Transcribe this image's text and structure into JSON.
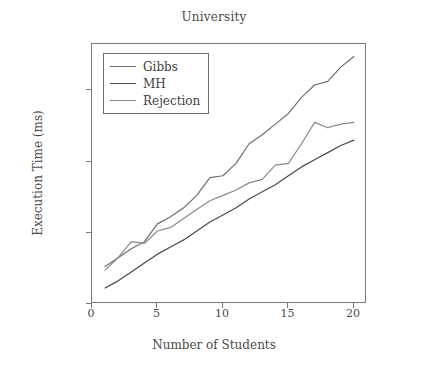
{
  "chart_data": {
    "type": "line",
    "title": "University",
    "xlabel": "Number of Students",
    "ylabel": "Execution Time (ms)",
    "xlim": [
      0,
      21
    ],
    "ylim": [
      0,
      7300
    ],
    "grid": false,
    "legend_position": "top-left",
    "xticks": [
      0,
      5,
      10,
      15,
      20
    ],
    "xtick_labels": [
      "0",
      "5",
      "10",
      "15",
      "20"
    ],
    "yticks": [
      0,
      2000,
      4000,
      6000
    ],
    "ytick_labels": [
      "0",
      "2,000",
      "4,000",
      "6,000"
    ],
    "x": [
      1,
      2,
      3,
      4,
      5,
      6,
      7,
      8,
      9,
      10,
      11,
      12,
      13,
      14,
      15,
      16,
      17,
      18,
      19,
      20
    ],
    "series": [
      {
        "name": "Gibbs",
        "color": "#6e6e6e",
        "values": [
          1050,
          1300,
          1550,
          1750,
          2250,
          2450,
          2700,
          3050,
          3550,
          3600,
          3950,
          4500,
          4750,
          5050,
          5350,
          5800,
          6150,
          6250,
          6650,
          6950
        ]
      },
      {
        "name": "MH",
        "color": "#4a4a4a",
        "values": [
          450,
          650,
          900,
          1150,
          1400,
          1600,
          1800,
          2050,
          2300,
          2500,
          2700,
          2950,
          3150,
          3350,
          3600,
          3850,
          4050,
          4250,
          4450,
          4600
        ]
      },
      {
        "name": "Rejection",
        "color": "#8a8a8a",
        "values": [
          950,
          1300,
          1750,
          1700,
          2050,
          2150,
          2400,
          2650,
          2900,
          3050,
          3200,
          3400,
          3500,
          3900,
          3950,
          4500,
          5100,
          4950,
          5050,
          5100
        ]
      }
    ]
  }
}
